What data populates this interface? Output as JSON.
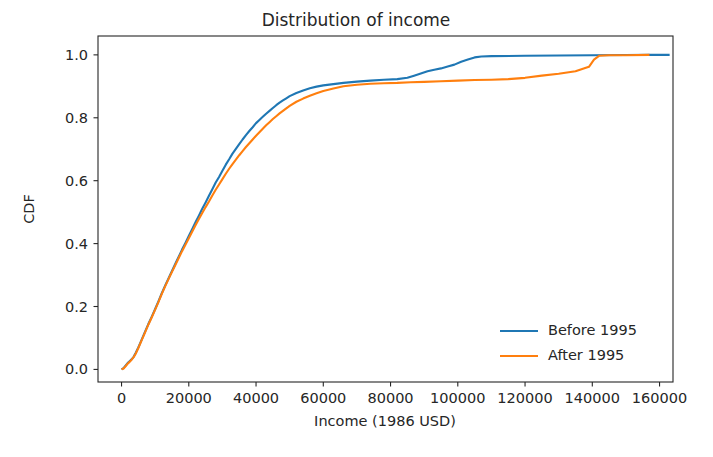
{
  "chart_data": {
    "type": "line",
    "title": "Distribution of income",
    "xlabel": "Income (1986 USD)",
    "ylabel": "CDF",
    "xlim": [
      -7000,
      164000
    ],
    "ylim": [
      -0.04,
      1.06
    ],
    "xticks": [
      0,
      20000,
      40000,
      60000,
      80000,
      100000,
      120000,
      140000,
      160000
    ],
    "xticklabels": [
      "0",
      "20000",
      "40000",
      "60000",
      "80000",
      "100000",
      "120000",
      "140000",
      "160000"
    ],
    "yticks": [
      0.0,
      0.2,
      0.4,
      0.6,
      0.8,
      1.0
    ],
    "yticklabels": [
      "0.0",
      "0.2",
      "0.4",
      "0.6",
      "0.8",
      "1.0"
    ],
    "grid": false,
    "legend_position": "lower right",
    "legend_frame": false,
    "series": [
      {
        "name": "Before 1995",
        "color": "#1f77b4",
        "points": [
          [
            0,
            0.0
          ],
          [
            600,
            0.004
          ],
          [
            1200,
            0.012
          ],
          [
            1800,
            0.02
          ],
          [
            2400,
            0.026
          ],
          [
            3000,
            0.032
          ],
          [
            3600,
            0.04
          ],
          [
            4200,
            0.052
          ],
          [
            5000,
            0.07
          ],
          [
            6000,
            0.095
          ],
          [
            7000,
            0.12
          ],
          [
            8000,
            0.145
          ],
          [
            9000,
            0.168
          ],
          [
            10000,
            0.192
          ],
          [
            11000,
            0.217
          ],
          [
            12000,
            0.243
          ],
          [
            13000,
            0.267
          ],
          [
            14000,
            0.29
          ],
          [
            15000,
            0.313
          ],
          [
            16000,
            0.336
          ],
          [
            17000,
            0.358
          ],
          [
            18000,
            0.381
          ],
          [
            19000,
            0.402
          ],
          [
            20000,
            0.424
          ],
          [
            21000,
            0.446
          ],
          [
            22000,
            0.468
          ],
          [
            23000,
            0.489
          ],
          [
            24000,
            0.511
          ],
          [
            25000,
            0.531
          ],
          [
            26000,
            0.552
          ],
          [
            27000,
            0.573
          ],
          [
            28000,
            0.594
          ],
          [
            29000,
            0.612
          ],
          [
            30000,
            0.632
          ],
          [
            31000,
            0.651
          ],
          [
            32000,
            0.668
          ],
          [
            33000,
            0.686
          ],
          [
            34000,
            0.701
          ],
          [
            35000,
            0.716
          ],
          [
            36000,
            0.731
          ],
          [
            37000,
            0.745
          ],
          [
            38000,
            0.758
          ],
          [
            39000,
            0.77
          ],
          [
            40000,
            0.783
          ],
          [
            41000,
            0.793
          ],
          [
            42000,
            0.803
          ],
          [
            43000,
            0.813
          ],
          [
            44000,
            0.822
          ],
          [
            45000,
            0.831
          ],
          [
            46000,
            0.84
          ],
          [
            47000,
            0.848
          ],
          [
            48000,
            0.855
          ],
          [
            49000,
            0.862
          ],
          [
            50000,
            0.869
          ],
          [
            52000,
            0.879
          ],
          [
            54000,
            0.887
          ],
          [
            56000,
            0.894
          ],
          [
            58000,
            0.899
          ],
          [
            60000,
            0.903
          ],
          [
            63000,
            0.907
          ],
          [
            66000,
            0.911
          ],
          [
            70000,
            0.915
          ],
          [
            74000,
            0.918
          ],
          [
            78000,
            0.921
          ],
          [
            82000,
            0.923
          ],
          [
            85000,
            0.927
          ],
          [
            87000,
            0.934
          ],
          [
            89000,
            0.941
          ],
          [
            91000,
            0.948
          ],
          [
            93000,
            0.953
          ],
          [
            95000,
            0.957
          ],
          [
            97000,
            0.963
          ],
          [
            99000,
            0.969
          ],
          [
            101000,
            0.978
          ],
          [
            103000,
            0.985
          ],
          [
            105000,
            0.992
          ],
          [
            107000,
            0.995
          ],
          [
            110000,
            0.996
          ],
          [
            120000,
            0.997
          ],
          [
            130000,
            0.998
          ],
          [
            140000,
            0.999
          ],
          [
            150000,
            0.9995
          ],
          [
            157000,
            1.0
          ],
          [
            163000,
            1.0
          ]
        ]
      },
      {
        "name": "After 1995",
        "color": "#ff7f0e",
        "points": [
          [
            0,
            0.0
          ],
          [
            600,
            0.003
          ],
          [
            1200,
            0.01
          ],
          [
            1800,
            0.018
          ],
          [
            2400,
            0.024
          ],
          [
            3000,
            0.031
          ],
          [
            3600,
            0.039
          ],
          [
            4200,
            0.05
          ],
          [
            5000,
            0.068
          ],
          [
            6000,
            0.093
          ],
          [
            7000,
            0.118
          ],
          [
            8000,
            0.143
          ],
          [
            9000,
            0.166
          ],
          [
            10000,
            0.19
          ],
          [
            11000,
            0.215
          ],
          [
            12000,
            0.241
          ],
          [
            13000,
            0.265
          ],
          [
            14000,
            0.288
          ],
          [
            15000,
            0.31
          ],
          [
            16000,
            0.332
          ],
          [
            17000,
            0.354
          ],
          [
            18000,
            0.376
          ],
          [
            19000,
            0.396
          ],
          [
            20000,
            0.417
          ],
          [
            21000,
            0.438
          ],
          [
            22000,
            0.458
          ],
          [
            23000,
            0.478
          ],
          [
            24000,
            0.497
          ],
          [
            25000,
            0.516
          ],
          [
            26000,
            0.534
          ],
          [
            27000,
            0.553
          ],
          [
            28000,
            0.571
          ],
          [
            29000,
            0.588
          ],
          [
            30000,
            0.605
          ],
          [
            31000,
            0.622
          ],
          [
            32000,
            0.638
          ],
          [
            33000,
            0.653
          ],
          [
            34000,
            0.667
          ],
          [
            35000,
            0.681
          ],
          [
            36000,
            0.694
          ],
          [
            37000,
            0.707
          ],
          [
            38000,
            0.719
          ],
          [
            39000,
            0.731
          ],
          [
            40000,
            0.743
          ],
          [
            41000,
            0.754
          ],
          [
            42000,
            0.765
          ],
          [
            43000,
            0.776
          ],
          [
            44000,
            0.786
          ],
          [
            45000,
            0.796
          ],
          [
            46000,
            0.805
          ],
          [
            47000,
            0.814
          ],
          [
            48000,
            0.822
          ],
          [
            49000,
            0.83
          ],
          [
            50000,
            0.838
          ],
          [
            52000,
            0.851
          ],
          [
            54000,
            0.861
          ],
          [
            56000,
            0.87
          ],
          [
            58000,
            0.878
          ],
          [
            60000,
            0.885
          ],
          [
            63000,
            0.893
          ],
          [
            66000,
            0.9
          ],
          [
            70000,
            0.905
          ],
          [
            74000,
            0.908
          ],
          [
            78000,
            0.91
          ],
          [
            82000,
            0.911
          ],
          [
            86000,
            0.913
          ],
          [
            90000,
            0.914
          ],
          [
            95000,
            0.916
          ],
          [
            100000,
            0.918
          ],
          [
            105000,
            0.92
          ],
          [
            110000,
            0.921
          ],
          [
            115000,
            0.923
          ],
          [
            120000,
            0.927
          ],
          [
            125000,
            0.934
          ],
          [
            130000,
            0.94
          ],
          [
            133000,
            0.945
          ],
          [
            135000,
            0.948
          ],
          [
            137000,
            0.955
          ],
          [
            139000,
            0.962
          ],
          [
            140500,
            0.985
          ],
          [
            142000,
            0.997
          ],
          [
            145000,
            0.999
          ],
          [
            150000,
            0.999
          ],
          [
            157000,
            1.0
          ]
        ]
      }
    ]
  }
}
